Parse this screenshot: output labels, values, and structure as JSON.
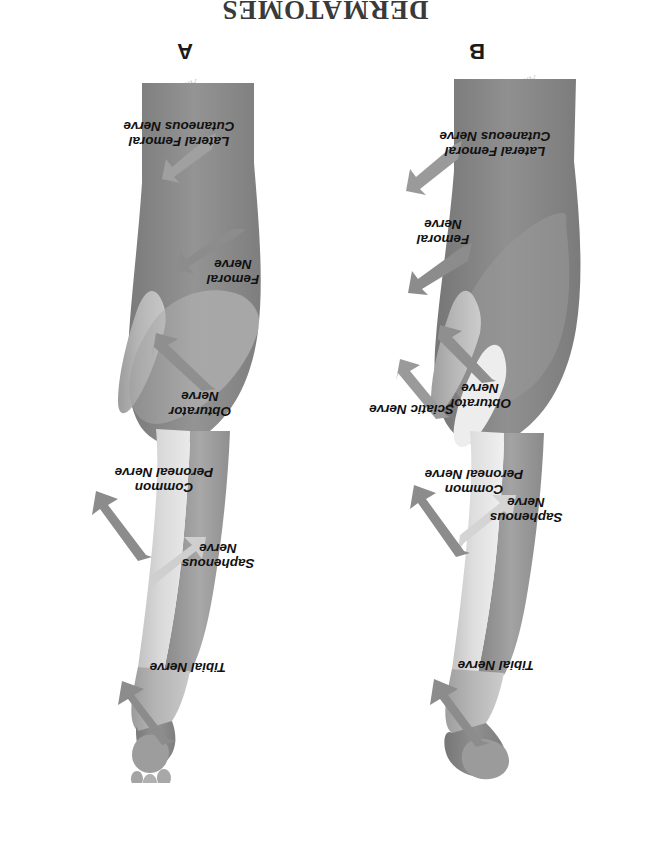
{
  "figure": {
    "title": "DERMATOMES",
    "orientation_note": "upside-down",
    "watermark_text": "Anatomy"
  },
  "panels": [
    {
      "id": "A",
      "letter": "A",
      "view": "anterior",
      "labels": [
        {
          "name": "tibial-nerve",
          "text": "Tibial Nerve"
        },
        {
          "name": "saphenous-nerve",
          "text": "Saphenous\nNerve"
        },
        {
          "name": "common-peroneal-nerve",
          "text": "Common\nPeroneal Nerve"
        },
        {
          "name": "obturator-nerve",
          "text": "Obturator\nNerve"
        },
        {
          "name": "femoral-nerve",
          "text": "Femoral\nNerve"
        },
        {
          "name": "lateral-femoral-cutaneous-nerve",
          "text": "Lateral Femoral\nCutaneous Nerve"
        }
      ]
    },
    {
      "id": "B",
      "letter": "B",
      "view": "posterior",
      "labels": [
        {
          "name": "tibial-nerve",
          "text": "Tibial Nerve"
        },
        {
          "name": "saphenous-nerve",
          "text": "Saphenous\nNerve"
        },
        {
          "name": "common-peroneal-nerve",
          "text": "Common\nPeroneal Nerve"
        },
        {
          "name": "sciatic-nerve",
          "text": "Sciatic Nerve"
        },
        {
          "name": "obturator-nerve",
          "text": "Obturator\nNerve"
        },
        {
          "name": "femoral-nerve",
          "text": "Femoral\nNerve"
        },
        {
          "name": "lateral-femoral-cutaneous-nerve",
          "text": "Lateral Femoral\nCutaneous Nerve"
        }
      ]
    }
  ],
  "colors": {
    "background": "#ffffff",
    "arrow": "#8c8c8c",
    "arrow_light": "#c5c5c5",
    "label_text": "#111111",
    "title_text": "#3a3a3a",
    "skin_light": "#ececec",
    "skin_pale": "#d8d8d8",
    "skin_mid": "#b9b9b9",
    "skin_dark": "#9a9a9a",
    "skin_darker": "#868686",
    "skin_deepest": "#777777"
  }
}
